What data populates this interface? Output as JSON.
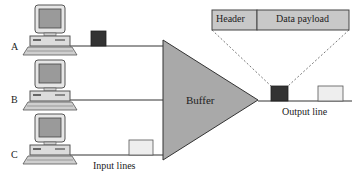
{
  "diagram": {
    "packet_format": {
      "header": "Header",
      "payload": "Data payload"
    },
    "buffer_label": "Buffer",
    "input_lines_label": "Input lines",
    "output_line_label": "Output line",
    "computers": [
      {
        "label": "A",
        "packet": "dark"
      },
      {
        "label": "B",
        "packet": "none"
      },
      {
        "label": "C",
        "packet": "light"
      }
    ],
    "output_packets": [
      "dark",
      "light"
    ],
    "colors": {
      "buffer_fill": "#a9a9a9",
      "dark_packet": "#333333",
      "light_packet": "#eeeeee",
      "header_box": "#c8c8c8",
      "line": "#333333"
    }
  }
}
